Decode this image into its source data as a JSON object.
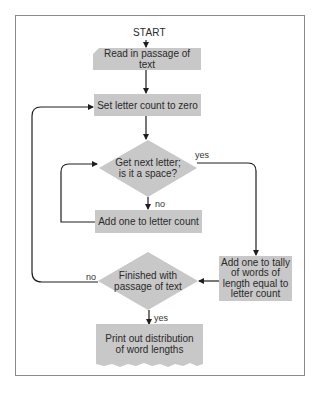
{
  "diagram": {
    "type": "flowchart",
    "start_label": "START",
    "nodes": {
      "read_passage": "Read in passage of text",
      "set_count_zero": "Set letter count to zero",
      "get_next_letter_line1": "Get next letter;",
      "get_next_letter_line2": "is it a space?",
      "add_letter_count": "Add one to letter count",
      "finished_line1": "Finished with",
      "finished_line2": "passage of text",
      "add_tally": "Add one to tally of words of length equal to letter count",
      "print_distribution": "Print out distribution of word lengths"
    },
    "edge_labels": {
      "space_yes": "yes",
      "space_no": "no",
      "finished_no": "no",
      "finished_yes": "yes"
    },
    "colors": {
      "box_fill": "#c8c8c8",
      "line": "#1e1e1e",
      "frame": "#8a8a8a"
    }
  }
}
